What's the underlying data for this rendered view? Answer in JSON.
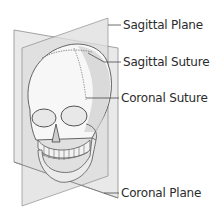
{
  "diagram": {
    "labels": [
      {
        "id": "sagittal-plane",
        "text": "Sagittal Plane",
        "x": 123,
        "y": 18
      },
      {
        "id": "sagittal-suture",
        "text": "Sagittal Suture",
        "x": 123,
        "y": 55
      },
      {
        "id": "coronal-suture",
        "text": "Coronal Suture",
        "x": 121,
        "y": 91
      },
      {
        "id": "coronal-plane",
        "text": "Coronal Plane",
        "x": 121,
        "y": 186
      }
    ],
    "colors": {
      "plane_fill": "#e4e4e4",
      "plane_stroke": "#7a7a7a",
      "leader_line": "#4a4a4a",
      "label_text": "#2b2b2b",
      "skull_light": "#fbfbfb",
      "skull_shade": "#bdbdbd"
    }
  }
}
